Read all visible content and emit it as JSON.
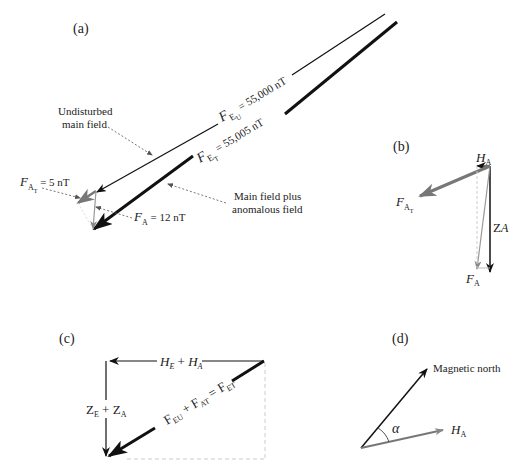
{
  "panels": {
    "a": {
      "label": "(a)",
      "undisturbed_label_line1": "Undisturbed",
      "undisturbed_label_line2": "main field",
      "anomalous_label_line1": "Main field plus",
      "anomalous_label_line2": "anomalous field",
      "feu": {
        "symbol": "F",
        "sub": "E",
        "subsub": "U",
        "value": " = 55,000 nT"
      },
      "fet": {
        "symbol": "F",
        "sub": "E",
        "subsub": "T",
        "value": " = 55,005 nT"
      },
      "fat": {
        "symbol": "F",
        "sub": "A",
        "subsub": "T",
        "value": " = 5 nT"
      },
      "fa": {
        "symbol": "F",
        "sub": "A",
        "value": " = 12 nT"
      }
    },
    "b": {
      "label": "(b)",
      "ha": {
        "symbol": "H",
        "sub": "A"
      },
      "fat": {
        "symbol": "F",
        "sub": "A",
        "subsub": "T"
      },
      "za": {
        "symbol": "Z",
        "sub": "A"
      },
      "fa": {
        "symbol": "F",
        "sub": "A"
      }
    },
    "c": {
      "label": "(c)",
      "horizontal": {
        "a": "H",
        "a_sub": "E",
        "plus": " + ",
        "b": "H",
        "b_sub": "A"
      },
      "vertical": {
        "a": "Z",
        "a_sub": "E",
        "plus": " + ",
        "b": "Z",
        "b_sub": "A"
      },
      "diagonal": {
        "t1": "F",
        "t1_sub": "EU",
        "plus": " + ",
        "t2": "F",
        "t2_sub": "AT",
        "eq": " = ",
        "t3": "F",
        "t3_sub": "ET"
      }
    },
    "d": {
      "label": "(d)",
      "north_label": "Magnetic north",
      "angle_label": "α",
      "ha": {
        "symbol": "H",
        "sub": "A"
      }
    }
  },
  "colors": {
    "black": "#111111",
    "grey": "#777777",
    "light_grey": "#aaaaaa",
    "dashed": "#bbbbbb"
  }
}
